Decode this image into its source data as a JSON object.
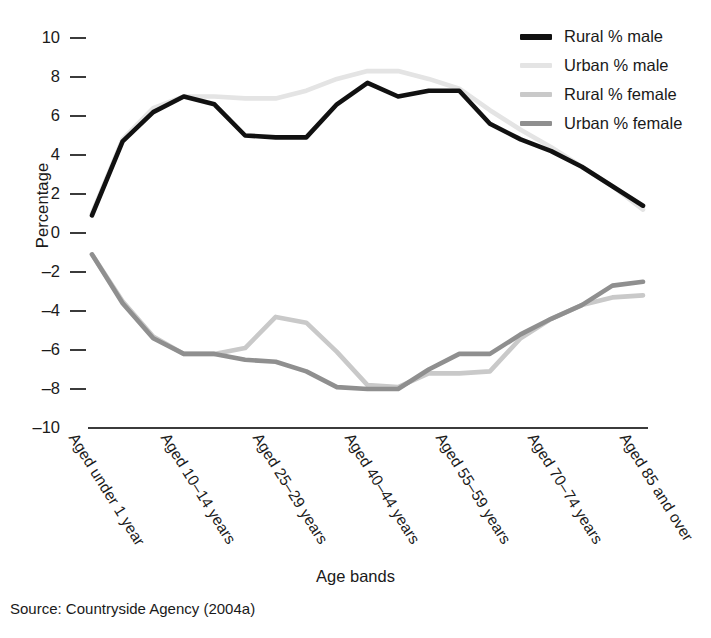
{
  "chart_data": {
    "type": "line",
    "title": "",
    "xlabel": "Age bands",
    "ylabel": "Percentage",
    "ylim": [
      -10,
      10
    ],
    "yticks": [
      10,
      8,
      6,
      4,
      2,
      0,
      -2,
      -4,
      -6,
      -8,
      -10
    ],
    "ytick_labels": [
      "10",
      "8",
      "6",
      "4",
      "2",
      "0",
      "–2",
      "–4",
      "–6",
      "–8",
      "–10"
    ],
    "grid": false,
    "legend_position": "top-right",
    "categories": [
      "Aged under 1 year",
      "Aged 1–4 years",
      "Aged 5–9 years",
      "Aged 10–14 years",
      "Aged 15–19 years",
      "Aged 20–24 years",
      "Aged 25–29 years",
      "Aged 30–34 years",
      "Aged 35–39 years",
      "Aged 40–44 years",
      "Aged 45–49 years",
      "Aged 50–54 years",
      "Aged 55–59 years",
      "Aged 60–64 years",
      "Aged 65–69 years",
      "Aged 70–74 years",
      "Aged 75–79 years",
      "Aged 80–84 years",
      "Aged 85 and over"
    ],
    "tick_labels_shown": [
      "Aged under 1 year",
      "Aged 10–14 years",
      "Aged 25–29 years",
      "Aged 40–44 years",
      "Aged 55–59 years",
      "Aged 70–74 years",
      "Aged 85 and over"
    ],
    "tick_label_indices": [
      0,
      3,
      6,
      9,
      12,
      15,
      18
    ],
    "series": [
      {
        "name": "Rural % male",
        "color": "#111111",
        "width": 4.6,
        "values": [
          0.9,
          4.7,
          6.2,
          7.0,
          6.6,
          5.0,
          4.9,
          4.9,
          6.6,
          7.7,
          7.0,
          7.3,
          7.3,
          5.6,
          4.8,
          4.2,
          3.4,
          2.4,
          1.4
        ]
      },
      {
        "name": "Urban % male",
        "color": "#e4e4e4",
        "width": 4.6,
        "values": [
          1.0,
          4.8,
          6.4,
          7.0,
          7.0,
          6.9,
          6.9,
          7.3,
          7.9,
          8.3,
          8.3,
          7.9,
          7.4,
          6.3,
          5.3,
          4.4,
          3.4,
          2.4,
          1.2
        ]
      },
      {
        "name": "Rural % female",
        "color": "#c9c9c9",
        "width": 4.6,
        "values": [
          -1.1,
          -3.5,
          -5.3,
          -6.2,
          -6.2,
          -5.9,
          -4.3,
          -4.6,
          -6.1,
          -7.8,
          -7.9,
          -7.2,
          -7.2,
          -7.1,
          -5.4,
          -4.4,
          -3.7,
          -3.3,
          -3.2
        ]
      },
      {
        "name": "Urban % female",
        "color": "#8f8f8f",
        "width": 4.6,
        "values": [
          -1.1,
          -3.6,
          -5.4,
          -6.2,
          -6.2,
          -6.5,
          -6.6,
          -7.1,
          -7.9,
          -8.0,
          -8.0,
          -7.0,
          -6.2,
          -6.2,
          -5.2,
          -4.4,
          -3.7,
          -2.7,
          -2.5
        ]
      }
    ]
  },
  "y_axis": {
    "title": "Percentage"
  },
  "x_axis": {
    "title": "Age bands"
  },
  "legend": {
    "items": [
      {
        "label": "Rural % male",
        "color": "#111111"
      },
      {
        "label": "Urban % male",
        "color": "#e4e4e4"
      },
      {
        "label": "Rural % female",
        "color": "#c9c9c9"
      },
      {
        "label": "Urban % female",
        "color": "#8f8f8f"
      }
    ]
  },
  "source": {
    "text": "Source: Countryside Agency (2004a)"
  }
}
